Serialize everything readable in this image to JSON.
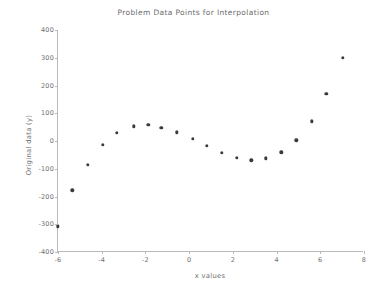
{
  "chart_data": {
    "type": "scatter",
    "title": "Problem Data Points for Interpolation",
    "xlabel": "x values",
    "ylabel": "Original data (y)",
    "xlim": [
      -6,
      8
    ],
    "ylim": [
      -400,
      400
    ],
    "xticks": [
      -6,
      -4,
      -2,
      0,
      2,
      4,
      6,
      8
    ],
    "yticks": [
      400,
      300,
      200,
      100,
      0,
      -100,
      -200,
      -300,
      -400
    ],
    "xtick_labels": [
      "-6",
      "-4",
      "-2",
      "0",
      "2",
      "4",
      "6",
      "8"
    ],
    "ytick_labels": [
      "400",
      "300",
      "200",
      "100",
      "0",
      "-100",
      "-200",
      "-300",
      "-400"
    ],
    "grid": false,
    "legend": null,
    "marker": "filled-circle",
    "marker_color": "#3b3b3b",
    "axis_color": "#b9b9b9",
    "background": "#ffffff",
    "series": [
      {
        "name": "Original data",
        "x": [
          -6.0,
          -5.35,
          -4.63,
          -3.95,
          -3.3,
          -2.53,
          -1.87,
          -1.28,
          -0.56,
          0.16,
          0.82,
          1.49,
          2.18,
          2.85,
          3.52,
          4.21,
          4.9,
          5.6,
          6.28,
          7.03
        ],
        "y": [
          -307,
          -177,
          -85,
          -13,
          30,
          53,
          58,
          48,
          31,
          9,
          -17,
          -43,
          -61,
          -69,
          -63,
          -41,
          3,
          71,
          170,
          300
        ]
      }
    ]
  }
}
